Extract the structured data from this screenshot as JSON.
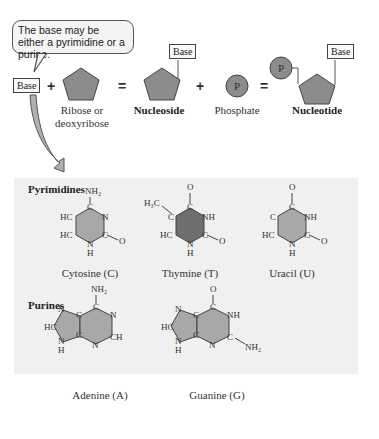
{
  "callout": {
    "text": "The base may be either a pyrimidine or a purine."
  },
  "equation": {
    "base_label": "Base",
    "plus1": "+",
    "sugar_label_line1": "Ribose or",
    "sugar_label_line2": "deoxyribose",
    "equals1": "=",
    "nucleoside_base": "Base",
    "nucleoside_label": "Nucleoside",
    "plus2": "+",
    "phosphate_glyph": "P",
    "phosphate_label": "Phosphate",
    "equals2": "=",
    "nucleotide_phosphate": "P",
    "nucleotide_base": "Base",
    "nucleotide_label": "Nucleotide"
  },
  "panel": {
    "pyrimidines_title": "Pyrimidines",
    "purines_title": "Purines",
    "molecules": [
      {
        "name": "Cytosine (C)"
      },
      {
        "name": "Thymine (T)"
      },
      {
        "name": "Uracil (U)"
      },
      {
        "name": "Adenine (A)"
      },
      {
        "name": "Guanine (G)"
      }
    ]
  },
  "colors": {
    "shape_fill": "#8c8c8c",
    "ring_light": "#a8a8a8",
    "ring_dark": "#6e6e6e",
    "panel_bg": "#f0f0f0"
  }
}
